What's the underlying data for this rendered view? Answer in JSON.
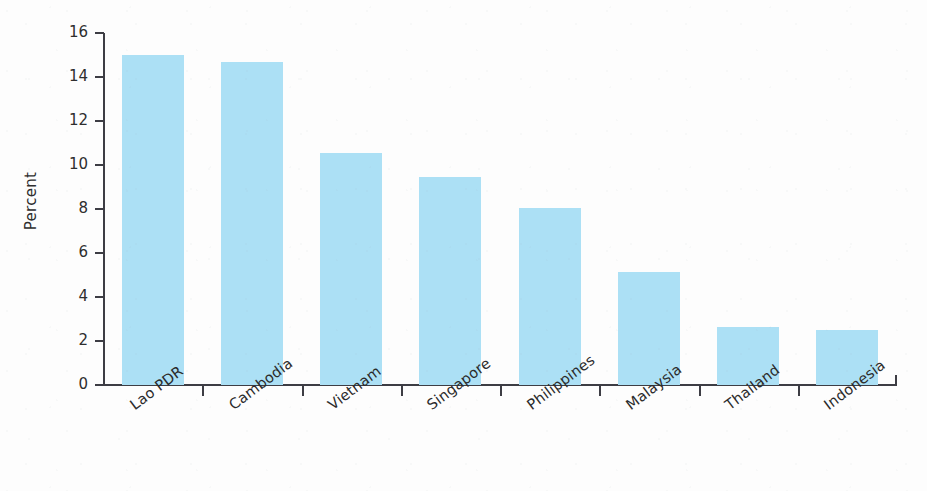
{
  "chart_data": {
    "type": "bar",
    "title": "",
    "subtitle": "",
    "xlabel": "",
    "ylabel": "Percent",
    "categories": [
      "Lao PDR",
      "Cambodia",
      "Vietnam",
      "Singapore",
      "Philippines",
      "Malaysia",
      "Thailand",
      "Indonesia"
    ],
    "values": [
      15.0,
      14.7,
      10.55,
      9.45,
      8.05,
      5.15,
      2.65,
      2.5
    ],
    "series": [
      {
        "name": "Percent",
        "values": [
          15.0,
          14.7,
          10.55,
          9.45,
          8.05,
          5.15,
          2.65,
          2.5
        ]
      }
    ],
    "ylim": [
      0,
      16
    ],
    "ytick_labels": [
      "0",
      "2",
      "4",
      "6",
      "8",
      "10",
      "12",
      "14",
      "16"
    ],
    "ytick_values": [
      0,
      2,
      4,
      6,
      8,
      10,
      12,
      14,
      16
    ],
    "grid": false,
    "legend": false,
    "legend_position": "none",
    "bar_color": "#ace0f5",
    "axis_color": "#3d3d44",
    "text_color": "#2e2e2e",
    "background_color": "#fdfdfd",
    "xtick_label_rotation": -37
  }
}
